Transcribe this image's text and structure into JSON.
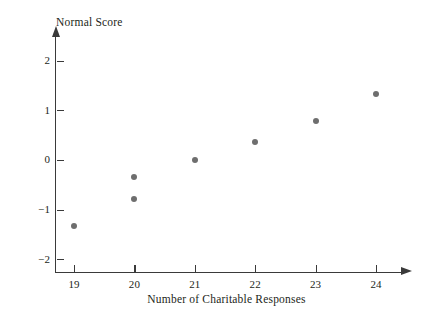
{
  "chart_data": {
    "type": "scatter",
    "title": "",
    "xlabel": "Number of Charitable Responses",
    "ylabel": "Normal Score",
    "x": [
      19,
      20,
      20,
      21,
      22,
      23,
      24
    ],
    "values": [
      -1.32,
      -0.78,
      -0.35,
      0.0,
      0.37,
      0.78,
      1.33
    ],
    "points": [
      {
        "x": 19,
        "y": -1.32
      },
      {
        "x": 20,
        "y": -0.78
      },
      {
        "x": 20,
        "y": -0.35
      },
      {
        "x": 21,
        "y": 0.0
      },
      {
        "x": 22,
        "y": 0.37
      },
      {
        "x": 23,
        "y": 0.78
      },
      {
        "x": 24,
        "y": 1.33
      }
    ],
    "xlim": [
      18.5,
      24.8
    ],
    "ylim": [
      -2.4,
      2.3
    ],
    "xticks": [
      19,
      20,
      21,
      22,
      23,
      24
    ],
    "xtick_labels": [
      "19",
      "20",
      "21",
      "22",
      "23",
      "24"
    ],
    "yticks": [
      -2,
      -1,
      0,
      1,
      2
    ],
    "ytick_labels": [
      "−2",
      "−1",
      "0",
      "1",
      "2"
    ],
    "grid": false,
    "legend": null,
    "marker_color": "#6e6e6e",
    "axis_color": "#3a3a3a",
    "background_color": "#ffffff"
  },
  "axes": {
    "y_title": "Normal Score",
    "x_title": "Number of Charitable Responses"
  }
}
